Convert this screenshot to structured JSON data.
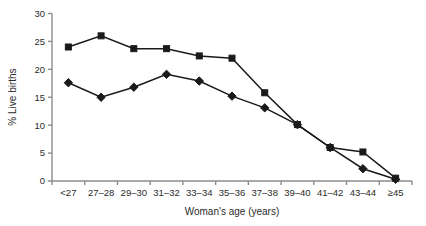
{
  "chart_data": {
    "type": "line",
    "title": "",
    "xlabel": "Woman's age (years)",
    "ylabel": "% Live births",
    "categories": [
      "<27",
      "27–28",
      "29–30",
      "31–32",
      "33–34",
      "35–36",
      "37–38",
      "39–40",
      "41–42",
      "43–44",
      "≥45"
    ],
    "series": [
      {
        "name": "square-series",
        "marker": "square",
        "color": "#1a1a1a",
        "values": [
          24.0,
          26.0,
          23.7,
          23.7,
          22.4,
          22.0,
          15.8,
          10.1,
          6.0,
          5.2,
          0.5
        ]
      },
      {
        "name": "diamond-series",
        "marker": "diamond",
        "color": "#1a1a1a",
        "values": [
          17.6,
          15.0,
          16.8,
          19.1,
          17.9,
          15.2,
          13.1,
          10.1,
          6.0,
          2.2,
          0.3
        ]
      }
    ],
    "ylim": [
      0,
      30
    ],
    "yticks": [
      0,
      5,
      10,
      15,
      20,
      25,
      30
    ],
    "ytick_labels": [
      "0",
      "5",
      "10",
      "15",
      "20",
      "25",
      "30"
    ],
    "grid": false,
    "legend": "none",
    "axis_color": "#8c8c8c",
    "line_color": "#1a1a1a"
  }
}
